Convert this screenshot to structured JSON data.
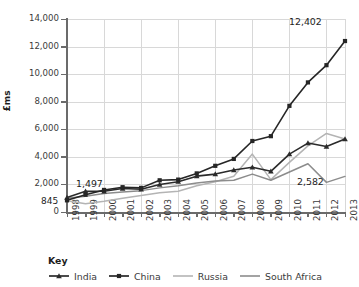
{
  "chart_data": {
    "type": "line",
    "title": "",
    "subtitle": "",
    "xlabel": "",
    "ylabel": "£ms",
    "ylim": [
      0,
      14000
    ],
    "ytick_step": 2000,
    "grid": true,
    "legend_position": "bottom",
    "legend_title": "Key",
    "categories": [
      "1998",
      "1999",
      "2000",
      "2001",
      "2002",
      "2003",
      "2004",
      "2005",
      "2006",
      "2007",
      "2008",
      "2009",
      "2010",
      "2011",
      "2012",
      "2013"
    ],
    "ytick_labels": [
      "14,000",
      "12,000",
      "10,000",
      "8,000",
      "6,000",
      "4,000",
      "2,000",
      "0"
    ],
    "ytick_values": [
      14000,
      12000,
      10000,
      8000,
      6000,
      4000,
      2000,
      0
    ],
    "series": [
      {
        "name": "India",
        "color": "#2b2b2b",
        "marker": "triangle",
        "values": [
          1050,
          1497,
          1500,
          1700,
          1650,
          2000,
          2200,
          2600,
          2750,
          3050,
          3250,
          2950,
          4200,
          5000,
          4750,
          5300
        ]
      },
      {
        "name": "China",
        "color": "#262626",
        "marker": "square",
        "values": [
          845,
          1250,
          1600,
          1800,
          1750,
          2300,
          2350,
          2800,
          3350,
          3850,
          5150,
          5500,
          7700,
          9400,
          10650,
          12402
        ]
      },
      {
        "name": "Russia",
        "color": "#b4b4b4",
        "marker": "none",
        "values": [
          820,
          600,
          780,
          1000,
          1200,
          1400,
          1500,
          1900,
          2200,
          2600,
          4200,
          2350,
          3600,
          4800,
          5700,
          5300
        ]
      },
      {
        "name": "South Africa",
        "color": "#8c8c8c",
        "marker": "none",
        "values": [
          1000,
          1150,
          1350,
          1450,
          1550,
          1750,
          1900,
          2100,
          2250,
          2300,
          2750,
          2300,
          2900,
          3500,
          2150,
          2582
        ]
      }
    ],
    "annotations": [
      {
        "id": "india-1999",
        "label": "1,497",
        "series": "India",
        "x": "1999",
        "value": 1497
      },
      {
        "id": "china-1998",
        "label": "845",
        "series": "China",
        "x": "1998",
        "value": 845
      },
      {
        "id": "china-2013",
        "label": "12,402",
        "series": "China",
        "x": "2013",
        "value": 12402
      },
      {
        "id": "southafrica-2013",
        "label": "2,582",
        "series": "South Africa",
        "x": "2013",
        "value": 2582
      }
    ]
  },
  "legend": {
    "title": "Key",
    "items": [
      {
        "label": "India",
        "color": "#2b2b2b",
        "marker": "triangle"
      },
      {
        "label": "China",
        "color": "#262626",
        "marker": "square"
      },
      {
        "label": "Russia",
        "color": "#b4b4b4",
        "marker": "none"
      },
      {
        "label": "South Africa",
        "color": "#8c8c8c",
        "marker": "none"
      }
    ]
  }
}
